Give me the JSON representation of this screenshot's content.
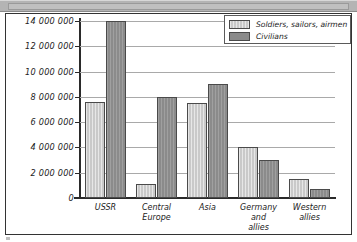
{
  "chart_data": {
    "type": "bar",
    "title": "",
    "xlabel": "",
    "ylabel": "",
    "ylim": [
      0,
      14000000
    ],
    "ytick_step": 2000000,
    "grid": true,
    "legend_position": "top-right",
    "categories": [
      "USSR",
      "Central\nEurope",
      "Asia",
      "Germany\nand\nallies",
      "Western\nallies"
    ],
    "ytick_labels": [
      "14 000 000",
      "12 000 000",
      "10 000 000",
      "8 000 000",
      "6 000 000",
      "4 000 000",
      "2 000 000",
      "0"
    ],
    "ytick_values": [
      14000000,
      12000000,
      10000000,
      8000000,
      6000000,
      4000000,
      2000000,
      0
    ],
    "series": [
      {
        "name": "Soldiers, sailors, airmen",
        "key": "soldiers",
        "color": "#c9c9c9",
        "values": [
          7600000,
          1100000,
          7500000,
          4000000,
          1500000
        ]
      },
      {
        "name": "Civilians",
        "key": "civilians",
        "color": "#8b8b8b",
        "values": [
          14000000,
          8000000,
          9000000,
          3000000,
          700000
        ]
      }
    ]
  },
  "legend": {
    "entries": [
      {
        "label": "Soldiers, sailors, airmen"
      },
      {
        "label": "Civilians"
      }
    ]
  },
  "colors": {
    "soldiers": "#c9c9c9",
    "civilians": "#8b8b8b",
    "axis": "#2a2a2a",
    "grid": "#a9a9a9",
    "frame": "#333333",
    "top_strip": "#b4b4b4"
  }
}
